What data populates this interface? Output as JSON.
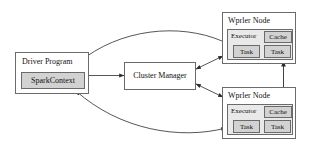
{
  "diagram": {
    "background_color": "#ffffff",
    "stroke_color": "#6b6b6b",
    "text_color": "#111111",
    "fill_light": "#e9e9e9",
    "fill_mid": "#d2d2d2",
    "width": 310,
    "height": 159
  },
  "driver": {
    "label": "Driver Program",
    "context_label": "SparkContext"
  },
  "cluster_manager": {
    "label": "Cluster Manager"
  },
  "workers": [
    {
      "label": "Wprler Node",
      "executor_label": "Executor",
      "cache_label": "Cache",
      "tasks": [
        "Task",
        "Task"
      ]
    },
    {
      "label": "Wprler Node",
      "executor_label": "Executor",
      "cache_label": "Cache",
      "tasks": [
        "Task",
        "Task"
      ]
    }
  ],
  "connections": [
    {
      "name": "sparkcontext-to-cluster-manager",
      "heads": "single"
    },
    {
      "name": "cluster-manager-to-worker-1",
      "heads": "double"
    },
    {
      "name": "cluster-manager-to-worker-2",
      "heads": "double"
    },
    {
      "name": "worker-1-to-sparkcontext",
      "heads": "single"
    },
    {
      "name": "worker-2-to-sparkcontext",
      "heads": "double"
    },
    {
      "name": "worker-1-to-worker-2",
      "heads": "double"
    }
  ]
}
